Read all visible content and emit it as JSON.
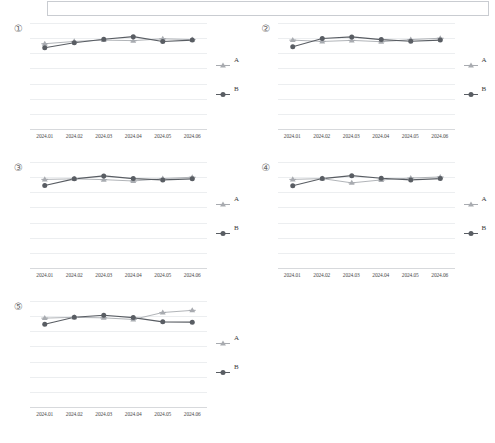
{
  "top_panel": {
    "name": "empty-bordered-panel"
  },
  "legend": {
    "series_a_label": "A",
    "series_b_label": "B",
    "a_marker": "triangle-star-marker",
    "b_marker": "filled-circle-marker"
  },
  "colors": {
    "series_a": "#a8abb0",
    "series_b": "#595d63",
    "gridline": "#eceef0",
    "axis": "#d7d9dc",
    "text": "#3a3a3a"
  },
  "axis": {
    "gridline_count": 8,
    "ymin": 0,
    "ymax": 8
  },
  "chart_data": [
    {
      "type": "line",
      "index_label": "①",
      "title": "",
      "xlabel": "",
      "ylabel": "",
      "categories": [
        "2024.01",
        "2024.02",
        "2024.03",
        "2024.04",
        "2024.05",
        "2024.06"
      ],
      "ylim": [
        0,
        8
      ],
      "grid": true,
      "legend_position": "right",
      "series": [
        {
          "name": "A",
          "values": [
            6.45,
            6.62,
            6.72,
            6.68,
            6.82,
            6.76
          ]
        },
        {
          "name": "B",
          "values": [
            6.15,
            6.52,
            6.78,
            6.98,
            6.62,
            6.72
          ]
        }
      ]
    },
    {
      "type": "line",
      "index_label": "②",
      "title": "",
      "xlabel": "",
      "ylabel": "",
      "categories": [
        "2024.01",
        "2024.02",
        "2024.03",
        "2024.04",
        "2024.05",
        "2024.06"
      ],
      "ylim": [
        0,
        8
      ],
      "grid": true,
      "legend_position": "right",
      "series": [
        {
          "name": "A",
          "values": [
            6.72,
            6.62,
            6.7,
            6.6,
            6.76,
            6.86
          ]
        },
        {
          "name": "B",
          "values": [
            6.22,
            6.84,
            6.96,
            6.76,
            6.64,
            6.72
          ]
        }
      ]
    },
    {
      "type": "line",
      "index_label": "③",
      "title": "",
      "xlabel": "",
      "ylabel": "",
      "categories": [
        "2024.01",
        "2024.02",
        "2024.03",
        "2024.04",
        "2024.05",
        "2024.06"
      ],
      "ylim": [
        0,
        8
      ],
      "grid": true,
      "legend_position": "right",
      "series": [
        {
          "name": "A",
          "values": [
            6.7,
            6.74,
            6.68,
            6.58,
            6.76,
            6.86
          ]
        },
        {
          "name": "B",
          "values": [
            6.24,
            6.74,
            6.96,
            6.76,
            6.66,
            6.74
          ]
        }
      ]
    },
    {
      "type": "line",
      "index_label": "④",
      "title": "",
      "xlabel": "",
      "ylabel": "",
      "categories": [
        "2024.01",
        "2024.02",
        "2024.03",
        "2024.04",
        "2024.05",
        "2024.06"
      ],
      "ylim": [
        0,
        8
      ],
      "grid": true,
      "legend_position": "right",
      "series": [
        {
          "name": "A",
          "values": [
            6.7,
            6.76,
            6.44,
            6.66,
            6.8,
            6.88
          ]
        },
        {
          "name": "B",
          "values": [
            6.22,
            6.76,
            6.98,
            6.78,
            6.66,
            6.76
          ]
        }
      ]
    },
    {
      "type": "line",
      "index_label": "⑤",
      "title": "",
      "xlabel": "",
      "ylabel": "",
      "categories": [
        "2024.01",
        "2024.02",
        "2024.03",
        "2024.04",
        "2024.05",
        "2024.06"
      ],
      "ylim": [
        0,
        8
      ],
      "grid": true,
      "legend_position": "right",
      "series": [
        {
          "name": "A",
          "values": [
            6.72,
            6.78,
            6.74,
            6.62,
            7.14,
            7.3
          ]
        },
        {
          "name": "B",
          "values": [
            6.26,
            6.78,
            6.94,
            6.76,
            6.44,
            6.42
          ]
        }
      ]
    }
  ]
}
